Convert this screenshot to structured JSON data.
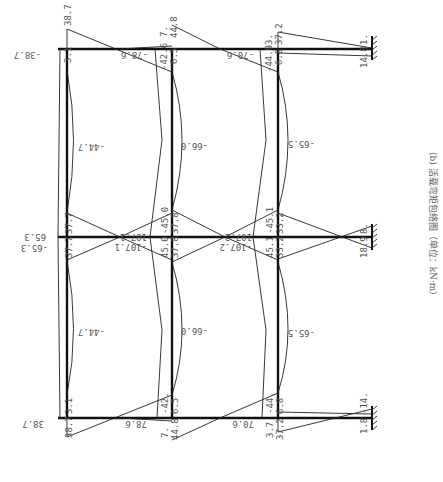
{
  "caption": "(b) 活载弯矩包络图（单位：kN·m）",
  "orientation": "rotated 90° — columns drawn horizontally, fixed supports on the right",
  "top_column_line": {
    "left_end_label": "-38.7",
    "joint1": {
      "labels": [
        "38.7",
        "3.1"
      ]
    },
    "beam1_span_label": "-78.6",
    "joint2": {
      "labels": [
        "7.",
        "44.8",
        "-42.6",
        "6.5"
      ]
    },
    "beam2_span_label": "-70.6",
    "joint3": {
      "labels": [
        "3.",
        "37.2",
        "-44.9",
        "6.8"
      ]
    },
    "support_labels": [
      "1.",
      "14.8"
    ]
  },
  "middle_column_line": {
    "left_end_labels": [
      "65.3",
      "-65.3"
    ],
    "joint1": {
      "labels": [
        "37.7",
        "37.7"
      ]
    },
    "span1_labels": [
      "107.1",
      "-107.1"
    ],
    "joint2": {
      "labels": [
        "-45.0",
        "45.0",
        "37.8",
        "37.8"
      ]
    },
    "span2_labels": [
      "107.2",
      "-107.2"
    ],
    "joint3": {
      "labels": [
        "-45.1",
        "45.1",
        "33.2",
        "33.2"
      ]
    },
    "support_labels": [
      "8.",
      "18.9"
    ]
  },
  "bottom_column_line": {
    "left_end_label": "38.7",
    "joint1": {
      "labels": [
        "3.1",
        "38.7"
      ]
    },
    "beam1_span_label": "78.6",
    "joint2": {
      "labels": [
        "-42.",
        "6.5",
        "7.",
        "44.8"
      ]
    },
    "beam2_span_label": "70.6",
    "joint3": {
      "labels": [
        "-44.",
        "6.8",
        "3.7",
        "37.2"
      ]
    },
    "support_labels": [
      "-14.",
      "1.8"
    ]
  },
  "beam_midspan_labels": {
    "beam1_upper": "-44.7",
    "beam1_lower": "-44.7",
    "beam2_upper": "-66.0",
    "beam2_lower": "-66.0",
    "beam3_upper": "-65.5",
    "beam3_lower": "-65.5"
  }
}
